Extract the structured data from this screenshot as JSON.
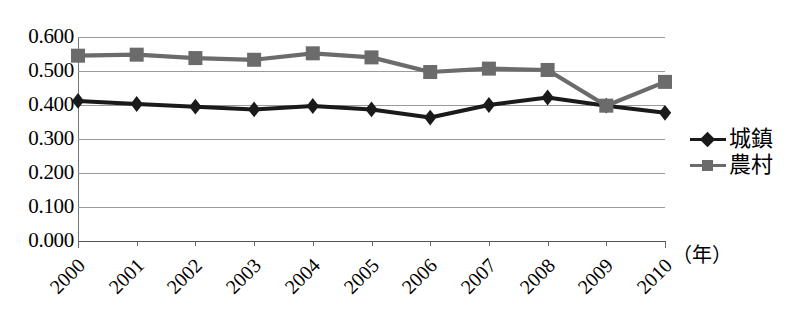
{
  "chart_data": {
    "type": "line",
    "title": "",
    "xlabel": "（年）",
    "ylabel": "",
    "ylim": [
      0.0,
      0.6
    ],
    "ytick_labels": [
      "0.600",
      "0.500",
      "0.400",
      "0.300",
      "0.200",
      "0.100",
      "0.000"
    ],
    "ytick_values": [
      0.6,
      0.5,
      0.4,
      0.3,
      0.2,
      0.1,
      0.0
    ],
    "grid": true,
    "legend_position": "right",
    "categories": [
      "2000",
      "2001",
      "2002",
      "2003",
      "2004",
      "2005",
      "2006",
      "2007",
      "2008",
      "2009",
      "2010"
    ],
    "series": [
      {
        "name": "城鎮",
        "marker": "diamond",
        "color": "#1a1a1a",
        "values": [
          0.412,
          0.403,
          0.395,
          0.387,
          0.397,
          0.387,
          0.363,
          0.4,
          0.422,
          0.398,
          0.377
        ]
      },
      {
        "name": "農村",
        "marker": "square",
        "color": "#6b6b6b",
        "values": [
          0.545,
          0.548,
          0.538,
          0.533,
          0.552,
          0.54,
          0.497,
          0.507,
          0.503,
          0.398,
          0.468
        ]
      }
    ]
  },
  "legend": {
    "items": [
      {
        "label": "城鎮",
        "marker": "diamond-marker",
        "color": "#1a1a1a"
      },
      {
        "label": "農村",
        "marker": "square-marker",
        "color": "#6b6b6b"
      }
    ]
  },
  "axis": {
    "x_unit": "（年）"
  },
  "caption": {
    "text": ""
  },
  "colors": {
    "urban_series": "#1a1a1a",
    "rural_series": "#6b6b6b",
    "gridline": "#9a9a9a",
    "axis": "#555555",
    "background": "#ffffff"
  }
}
